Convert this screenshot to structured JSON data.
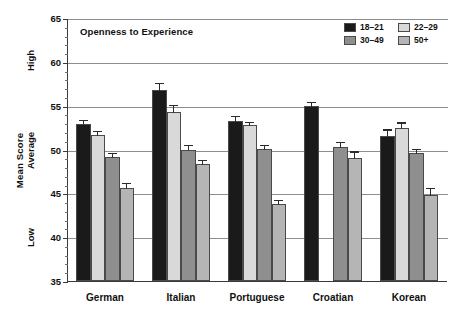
{
  "chart_data": {
    "type": "bar",
    "title": "Openness to Experience",
    "xlabel": "",
    "ylabel": "Mean Score",
    "ylim": [
      35,
      65
    ],
    "yticks": [
      35,
      40,
      45,
      50,
      55,
      60,
      65
    ],
    "ytick_labels": [
      "35",
      "40",
      "45",
      "50",
      "55",
      "60",
      "65"
    ],
    "y_category_labels": [
      "Low",
      "Average",
      "High"
    ],
    "grid": true,
    "legend_position": "top-right",
    "categories": [
      "German",
      "Italian",
      "Portuguese",
      "Croatian",
      "Korean"
    ],
    "series": [
      {
        "name": "18–21",
        "color": "#1a1a1a",
        "values": [
          52.9,
          56.8,
          53.3,
          55.0,
          51.5
        ],
        "errors": [
          0.6,
          0.9,
          0.6,
          0.5,
          0.9
        ]
      },
      {
        "name": "22–29",
        "color": "#d9d9d9",
        "values": [
          51.7,
          54.3,
          52.8,
          null,
          52.4
        ],
        "errors": [
          0.5,
          0.9,
          0.5,
          null,
          0.8
        ]
      },
      {
        "name": "30–49",
        "color": "#8f8f8f",
        "values": [
          49.2,
          50.0,
          50.1,
          50.3,
          49.6
        ],
        "errors": [
          0.5,
          0.6,
          0.5,
          0.7,
          0.6
        ]
      },
      {
        "name": "50+",
        "color": "#b5b5b5",
        "values": [
          45.6,
          48.3,
          43.8,
          49.0,
          44.8
        ],
        "errors": [
          0.7,
          0.6,
          0.6,
          0.9,
          0.9
        ]
      }
    ]
  },
  "legend": {
    "entries": [
      {
        "label": "18–21",
        "color": "#1a1a1a"
      },
      {
        "label": "22–29",
        "color": "#d9d9d9"
      },
      {
        "label": "30–49",
        "color": "#8f8f8f"
      },
      {
        "label": "50+",
        "color": "#b5b5b5"
      }
    ]
  },
  "axes": {
    "y_title": "Mean Score",
    "y_cat_high": "High",
    "y_cat_average": "Average",
    "y_cat_low": "Low"
  }
}
